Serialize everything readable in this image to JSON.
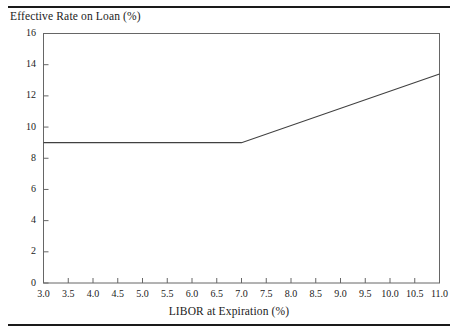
{
  "figure": {
    "y_axis_title": "Effective Rate on Loan (%)",
    "x_axis_title": "LIBOR at Expiration (%)"
  },
  "colors": {
    "line": "#404040",
    "axis": "#555555",
    "rule": "#1a1a1a",
    "text": "#1b1b1b",
    "background": "#ffffff"
  },
  "chart_data": {
    "type": "line",
    "title": "",
    "subtitle": "",
    "xlabel": "LIBOR at Expiration (%)",
    "ylabel": "Effective Rate on Loan (%)",
    "xlim": [
      3.0,
      11.0
    ],
    "ylim": [
      0,
      16
    ],
    "grid": false,
    "legend": "none",
    "xticks": [
      3.0,
      3.5,
      4.0,
      4.5,
      5.0,
      5.5,
      6.0,
      6.5,
      7.0,
      7.5,
      8.0,
      8.5,
      9.0,
      9.5,
      10.0,
      10.5,
      11.0
    ],
    "xticklabels": [
      "3.0",
      "3.5",
      "4.0",
      "4.5",
      "5.0",
      "5.5",
      "6.0",
      "6.5",
      "7.0",
      "7.5",
      "8.0",
      "8.5",
      "9.0",
      "9.5",
      "10.0",
      "10.5",
      "11.0"
    ],
    "yticks": [
      0,
      2,
      4,
      6,
      8,
      10,
      12,
      14,
      16
    ],
    "yticklabels": [
      "0",
      "2",
      "4",
      "6",
      "8",
      "10",
      "12",
      "14",
      "16"
    ],
    "series": [
      {
        "name": "Effective Rate on Loan",
        "x": [
          3.0,
          7.0,
          11.0
        ],
        "y": [
          9.0,
          9.0,
          13.4
        ]
      }
    ],
    "annotations": [
      {
        "text": "kink at cap strike",
        "x": 7.0,
        "y": 9.0
      }
    ]
  }
}
